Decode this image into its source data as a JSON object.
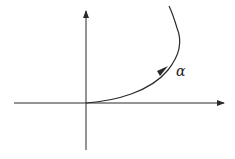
{
  "diagram": {
    "curve_label": "α",
    "colors": {
      "stroke": "#2a2a2a",
      "background": "#ffffff"
    }
  }
}
